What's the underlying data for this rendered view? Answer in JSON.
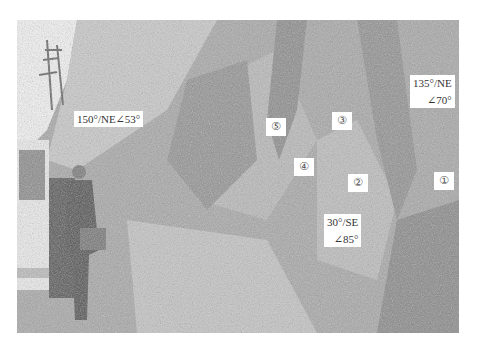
{
  "photo": {
    "description": "Grayscale field photograph of a weathered rock slope with a person standing next to a parked vehicle on the left",
    "orientation_labels": [
      {
        "id": "a",
        "text": "150°/NE∠53°"
      },
      {
        "id": "b",
        "line1": "135°/NE",
        "line2": "∠70°"
      },
      {
        "id": "c",
        "line1": "30°/SE",
        "line2": "∠85°"
      }
    ],
    "zone_markers": [
      {
        "id": "1",
        "text": "①"
      },
      {
        "id": "2",
        "text": "②"
      },
      {
        "id": "3",
        "text": "③"
      },
      {
        "id": "4",
        "text": "④"
      },
      {
        "id": "5",
        "text": "⑤"
      }
    ]
  }
}
